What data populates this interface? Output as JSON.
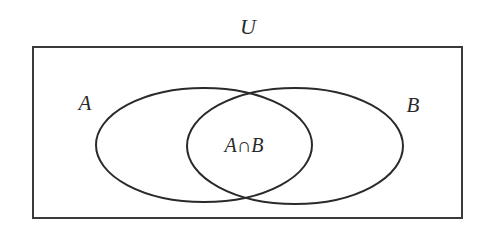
{
  "diagram": {
    "type": "venn",
    "universe_label": "U",
    "sets": [
      {
        "name": "A",
        "label": "A"
      },
      {
        "name": "B",
        "label": "B"
      }
    ],
    "intersection_label": "A∩B",
    "colors": {
      "stroke": "#2a2a2a",
      "background": "#ffffff"
    }
  }
}
